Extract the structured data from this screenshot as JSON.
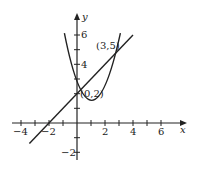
{
  "diagram": {
    "type": "function-graph",
    "axes": {
      "x_label": "x",
      "y_label": "y",
      "x_ticks": [
        "−4",
        "−2",
        "2",
        "4",
        "6"
      ],
      "y_ticks": [
        "6",
        "4",
        "−2"
      ]
    },
    "curves": [
      {
        "name": "parabola",
        "equation": "y = x^2 - 2x + 2"
      },
      {
        "name": "line",
        "equation": "y = x + 2"
      }
    ],
    "points": [
      {
        "label": "(0,2)",
        "x": 0,
        "y": 2
      },
      {
        "label": "(3,5)",
        "x": 3,
        "y": 5
      }
    ],
    "colors": {
      "stroke": "#222222",
      "background": "#ffffff"
    }
  }
}
